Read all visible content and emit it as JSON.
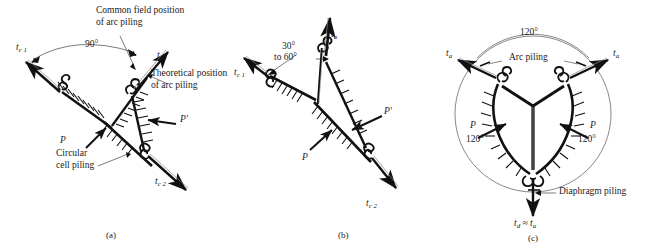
{
  "figure": {
    "kind": "engineering-diagram",
    "line_color": "#111111",
    "thin_line_color": "#555555",
    "background": "#ffffff"
  },
  "panels": [
    {
      "id": "a",
      "caption": "(a)",
      "labels": {
        "common_field": "Common field position\nof arc piling",
        "theoretical": "Theoretical position\nof arc piling",
        "circular_cell": "Circular\ncell piling",
        "angle": "90°",
        "tc1": "t",
        "tc1_sub": "c 1",
        "tc2": "t",
        "tc2_sub": "c 2",
        "ta": "t",
        "ta_sub": "a",
        "p": "P",
        "p_prime": "P'"
      }
    },
    {
      "id": "b",
      "caption": "(b)",
      "labels": {
        "angle_line1": "30°",
        "angle_line2": "to 60°",
        "tc1": "t",
        "tc1_sub": "c 1",
        "tc2": "t",
        "tc2_sub": "c 2",
        "ta": "t",
        "ta_sub": "a",
        "p": "P",
        "p_prime": "P'"
      }
    },
    {
      "id": "c",
      "caption": "(c)",
      "labels": {
        "angle_top": "120°",
        "angle_left": "120°",
        "angle_right": "120°",
        "arc_piling": "Arc piling",
        "diaphragm_piling": "Diaphragm piling",
        "ta_left": "t",
        "ta_left_sub": "a",
        "ta_right": "t",
        "ta_right_sub": "a",
        "p_left": "P",
        "p_right": "P",
        "td": "t",
        "td_sub": "d",
        "approx": " ≈ ",
        "td_ta": "t",
        "td_ta_sub": "a"
      }
    }
  ]
}
